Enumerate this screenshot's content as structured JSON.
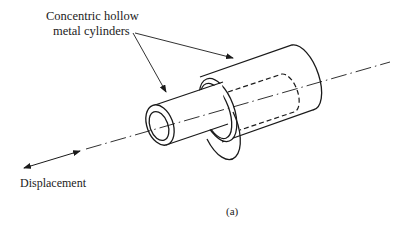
{
  "figure": {
    "label_top_line1": "Concentric hollow",
    "label_top_line2": "metal cylinders",
    "displacement_label": "Displacement",
    "caption": "(a)"
  },
  "components": [
    {
      "name": "inner-cylinder",
      "description": "smaller hollow metal cylinder, protrudes from outer cylinder"
    },
    {
      "name": "outer-cylinder",
      "description": "larger hollow metal cylinder, inner cylinder shown dashed inside"
    },
    {
      "name": "center-axis",
      "description": "dash-dot centerline through both cylinders"
    },
    {
      "name": "displacement-arrow",
      "description": "double-headed arrow along axis indicating displacement"
    }
  ],
  "colors": {
    "stroke": "#1a1a1a",
    "background": "#ffffff"
  }
}
